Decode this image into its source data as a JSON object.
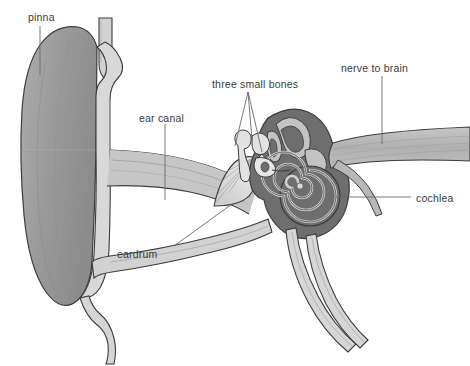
{
  "diagram": {
    "background_color": "#ffffff",
    "palette": {
      "outline": "#3c3c3c",
      "pinna_fill": "#9a9a9a",
      "canal_fill": "#c9c9c9",
      "skin_light": "#d9d9d9",
      "inner_ear_dark": "#6e6e6e",
      "bone_light": "#e2e2e2",
      "nerve_fill": "#b4b4b4",
      "label_color": "#3a3a3a",
      "leader_color": "#6a6a6a"
    },
    "labels": [
      {
        "id": "pinna",
        "text": "pinna",
        "x": 28,
        "y": 12,
        "leader": "vertical-down"
      },
      {
        "id": "ear-canal",
        "text": "ear canal",
        "x": 139,
        "y": 113,
        "leader": "vertical-down"
      },
      {
        "id": "three-small-bones",
        "text": "three small bones",
        "x": 212,
        "y": 79,
        "leader": "three-fan-down"
      },
      {
        "id": "nerve-to-brain",
        "text": "nerve to brain",
        "x": 341,
        "y": 63,
        "leader": "vertical-down"
      },
      {
        "id": "cochlea",
        "text": "cochlea",
        "x": 416,
        "y": 193,
        "leader": "horizontal-left"
      },
      {
        "id": "eardrum",
        "text": "eardrum",
        "x": 117,
        "y": 249,
        "leader": "diagonal-up-right"
      }
    ],
    "structures": [
      {
        "name": "pinna",
        "description": "outer ear flap, mid-gray"
      },
      {
        "name": "ear-canal",
        "description": "light channel from pinna to eardrum"
      },
      {
        "name": "eardrum",
        "description": "fan-shaped membrane with radial striations"
      },
      {
        "name": "ossicles",
        "description": "three small bones: malleus, incus, stapes"
      },
      {
        "name": "semicircular-canals",
        "description": "dark looped canals above cochlea"
      },
      {
        "name": "cochlea",
        "description": "dark spiral of about two and a half turns"
      },
      {
        "name": "auditory-nerve",
        "description": "striated band running to the right"
      },
      {
        "name": "eustachian-tube",
        "description": "paired tube descending to lower right"
      }
    ]
  }
}
